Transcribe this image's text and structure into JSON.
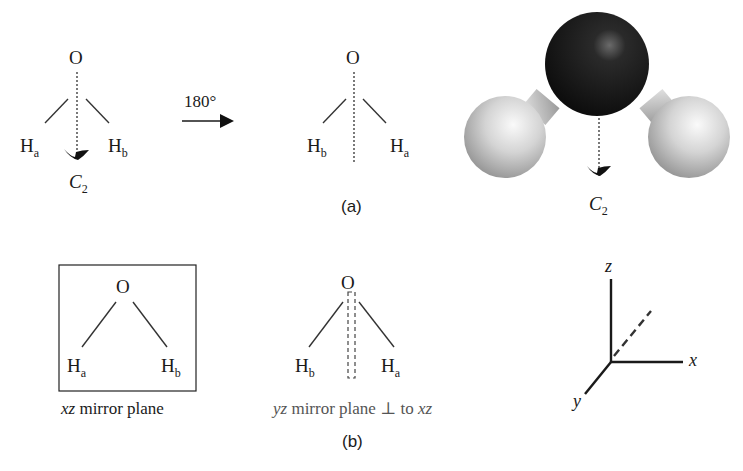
{
  "panel_a": {
    "label": "(a)",
    "left_molecule": {
      "center_atom": "O",
      "left_atom": "H",
      "left_sub": "a",
      "right_atom": "H",
      "right_sub": "b",
      "axis_label": "C",
      "axis_sub": "2"
    },
    "rotation": {
      "label": "180°"
    },
    "rotated_molecule": {
      "center_atom": "O",
      "left_atom": "H",
      "left_sub": "b",
      "right_atom": "H",
      "right_sub": "a"
    },
    "space_filling_model": {
      "axis_label": "C",
      "axis_sub": "2",
      "oxygen_color": "#151515",
      "hydrogen_color": "#d9d9d9"
    }
  },
  "panel_b": {
    "label": "(b)",
    "xz_plane": {
      "center_atom": "O",
      "left_atom": "H",
      "left_sub": "a",
      "right_atom": "H",
      "right_sub": "b",
      "caption_italic": "xz",
      "caption_rest": " mirror plane"
    },
    "yz_plane": {
      "center_atom": "O",
      "left_atom": "H",
      "left_sub": "b",
      "right_atom": "H",
      "right_sub": "a",
      "caption_italic_1": "yz",
      "caption_mid": " mirror plane ⊥ to ",
      "caption_italic_2": "xz"
    },
    "axes": {
      "z": "z",
      "x": "x",
      "y": "y"
    }
  }
}
